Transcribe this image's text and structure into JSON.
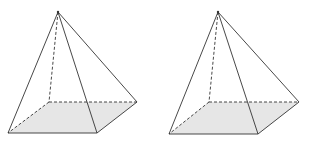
{
  "figure": {
    "colors": {
      "stroke": "#333333",
      "base_fill": "#e6e6e6",
      "background": "#ffffff"
    },
    "pyramids": [
      {
        "name": "left-pyramid",
        "apex": [
          58,
          12
        ],
        "base": {
          "back_left": [
            49,
            102
          ],
          "back_right": [
            137,
            102
          ],
          "front_right": [
            97,
            133
          ],
          "front_left": [
            8,
            133
          ]
        }
      },
      {
        "name": "right-pyramid",
        "apex": [
          218,
          12
        ],
        "base": {
          "back_left": [
            209,
            102
          ],
          "back_right": [
            299,
            102
          ],
          "front_right": [
            258,
            134
          ],
          "front_left": [
            169,
            134
          ]
        }
      }
    ]
  }
}
